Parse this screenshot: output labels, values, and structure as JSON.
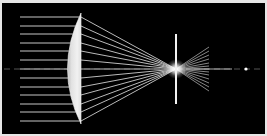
{
  "figure": {
    "kind": "optical-ray-diagram",
    "canvas": {
      "width": 267,
      "height": 136
    },
    "background_color": "#000000",
    "border_color": "#e6e6e6",
    "border_width": 2,
    "plot_area": {
      "x": 2,
      "y": 3,
      "width": 263,
      "height": 131
    }
  },
  "optical_axis": {
    "label": "optical-axis",
    "y": 69,
    "x_start": 4,
    "x_end": 262,
    "color": "#9a9a9a",
    "dash": "6,4",
    "width": 1
  },
  "incoming_rays": {
    "label": "collimated-input-rays",
    "color": "#d9d9d9",
    "width": 1,
    "x_start": 20,
    "count": 13,
    "y_values": [
      17,
      26,
      34,
      43,
      51,
      60,
      69,
      78,
      87,
      95,
      104,
      112,
      121
    ]
  },
  "lens": {
    "label": "plano-convex-lens",
    "fill_color": "#ededed",
    "edge_color": "#ffffff",
    "flat_face_x": 81,
    "apex_x": 54,
    "top_y": 13,
    "bottom_y": 124,
    "center_y": 69,
    "flat_side": "right",
    "curved_side": "left"
  },
  "converging_rays": {
    "label": "converging-output-rays",
    "color": "#cfcfcf",
    "width": 1,
    "focus_x": 176,
    "focus_y": 69,
    "start_x": 81,
    "count": 13,
    "start_y_values": [
      17,
      26,
      34,
      43,
      51,
      60,
      69,
      78,
      87,
      95,
      104,
      112,
      121
    ]
  },
  "diverging_rays": {
    "label": "diverging-rays-past-focus",
    "color": "#b9b9b9",
    "width": 1,
    "end_x": 209,
    "count": 13,
    "end_y_values": [
      47,
      51,
      55,
      59,
      63,
      66,
      69,
      72,
      75,
      79,
      83,
      87,
      91
    ]
  },
  "focal_glow": {
    "label": "focal-point-caustic",
    "x": 176,
    "y": 69,
    "radius": 10,
    "color": "#ffffff"
  },
  "screen_line": {
    "label": "image-plane-screen",
    "x": 176,
    "y_top": 34,
    "y_bottom": 104,
    "color": "#f2f2f2",
    "width": 2
  },
  "far_point": {
    "label": "distant-point-source",
    "x": 246,
    "y": 69,
    "radius": 1.6,
    "color": "#ffffff"
  },
  "axis_stub": {
    "label": "axis-continuation-segment",
    "x_start": 186,
    "x_end": 232,
    "y": 69,
    "color": "#cccccc"
  }
}
